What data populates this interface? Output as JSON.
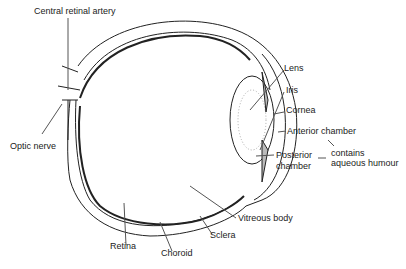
{
  "diagram": {
    "type": "anatomical cross-section",
    "labels": {
      "central_retinal_artery": "Central retinal artery",
      "optic_nerve": "Optic nerve",
      "lens": "Lens",
      "iris": "Iris",
      "cornea": "Cornea",
      "anterior_chamber": "Anterior chamber",
      "posterior_chamber_1": "Posterior",
      "posterior_chamber_2": "chamber",
      "contains_1": "contains",
      "contains_2": "aqueous humour",
      "vitreous_body": "Vitreous body",
      "sclera": "Sclera",
      "retina": "Retina",
      "choroid": "Choroid"
    }
  }
}
